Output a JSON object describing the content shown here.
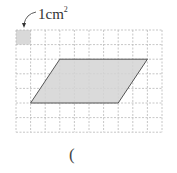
{
  "diagram": {
    "unit_label": "1cm",
    "unit_label_exponent": "2",
    "answer_paren": "(",
    "grid": {
      "columns": 10,
      "rows": 7,
      "cell_px": 14.6,
      "origin": [
        16,
        30
      ],
      "line_color": "#b8b8b8"
    },
    "unit_square": {
      "col": 0,
      "row": 0,
      "fill": "#d9d9d9"
    },
    "parallelogram": {
      "vertices_grid": [
        [
          1,
          5
        ],
        [
          7,
          5
        ],
        [
          9,
          2
        ],
        [
          3,
          2
        ]
      ],
      "fill": "#d4d4d4",
      "stroke": "#555555"
    }
  }
}
